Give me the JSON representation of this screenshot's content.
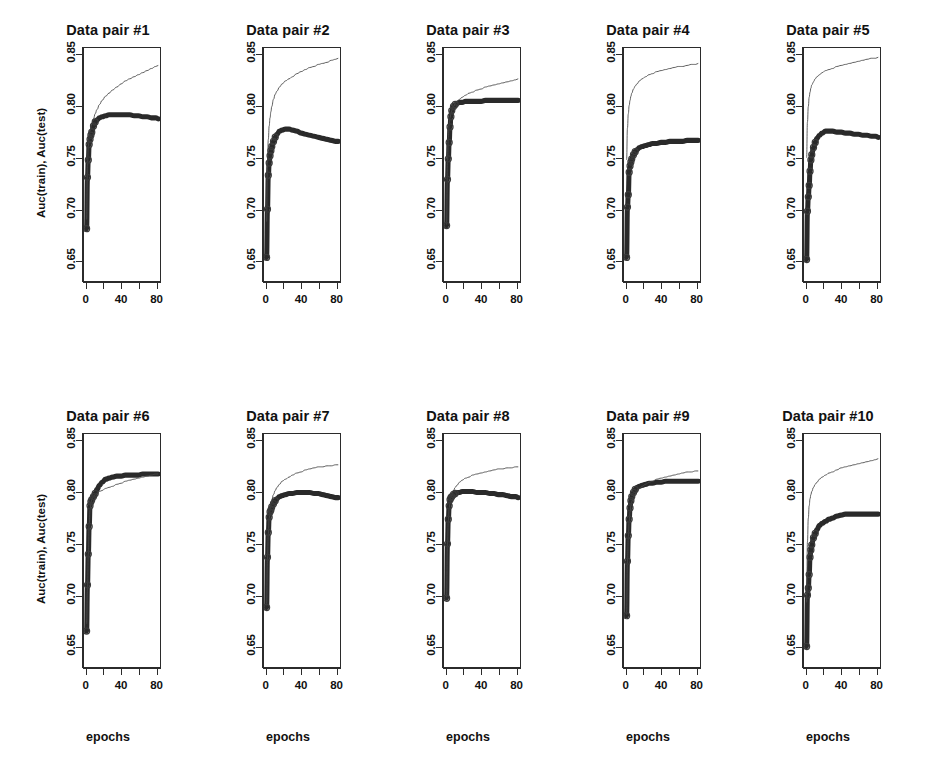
{
  "figure": {
    "axis_labels": {
      "y": "Auc(train), Auc(test)",
      "x": "epochs"
    },
    "panel_cols": 5,
    "panel_rows": 2
  },
  "axes": {
    "ylim": [
      0.63,
      0.857
    ],
    "xlim": [
      -3,
      85
    ],
    "y_ticks": [
      0.65,
      0.7,
      0.75,
      0.8,
      0.85
    ],
    "y_tick_labels": [
      "0.65",
      "0.70",
      "0.75",
      "0.80",
      "0.85"
    ],
    "x_ticks": [
      0,
      20,
      40,
      60,
      80
    ],
    "x_tick_labels": [
      "0",
      "",
      "40",
      "",
      "80"
    ],
    "grid": false
  },
  "legend": {
    "present": false
  },
  "series_names": {
    "train": "Auc(train)",
    "test": "Auc(test)"
  },
  "chart_data": {
    "type": "line",
    "title": "",
    "xlabel": "epochs",
    "ylabel": "Auc(train), Auc(test)",
    "xlim": [
      -3,
      85
    ],
    "ylim": [
      0.63,
      0.857
    ],
    "grid": false,
    "legend_position": "none",
    "x": [
      0,
      1,
      2,
      3,
      4,
      5,
      6,
      8,
      10,
      12,
      15,
      18,
      22,
      26,
      30,
      35,
      40,
      45,
      50,
      55,
      60,
      65,
      70,
      75,
      80,
      83
    ],
    "panels": [
      {
        "title": "Data pair #1",
        "series": [
          {
            "name": "Auc(train)",
            "style": "thin-line",
            "values": [
              0.69,
              0.742,
              0.761,
              0.77,
              0.776,
              0.78,
              0.783,
              0.788,
              0.793,
              0.797,
              0.802,
              0.806,
              0.81,
              0.813,
              0.816,
              0.819,
              0.822,
              0.825,
              0.827,
              0.829,
              0.831,
              0.833,
              0.835,
              0.837,
              0.839,
              0.84
            ]
          },
          {
            "name": "Auc(test)",
            "style": "thick-line-with-open-circles",
            "values": [
              0.681,
              0.731,
              0.748,
              0.763,
              0.768,
              0.772,
              0.775,
              0.781,
              0.785,
              0.787,
              0.789,
              0.79,
              0.791,
              0.792,
              0.792,
              0.792,
              0.792,
              0.792,
              0.792,
              0.791,
              0.791,
              0.79,
              0.79,
              0.789,
              0.789,
              0.788
            ]
          }
        ]
      },
      {
        "title": "Data pair #2",
        "series": [
          {
            "name": "Auc(train)",
            "style": "thin-line",
            "values": [
              0.688,
              0.745,
              0.768,
              0.781,
              0.789,
              0.795,
              0.8,
              0.807,
              0.812,
              0.815,
              0.819,
              0.822,
              0.825,
              0.827,
              0.829,
              0.832,
              0.834,
              0.836,
              0.838,
              0.839,
              0.841,
              0.842,
              0.843,
              0.845,
              0.846,
              0.847
            ]
          },
          {
            "name": "Auc(test)",
            "style": "thick-line-with-open-circles",
            "values": [
              0.653,
              0.7,
              0.733,
              0.745,
              0.752,
              0.757,
              0.761,
              0.766,
              0.77,
              0.773,
              0.776,
              0.777,
              0.778,
              0.778,
              0.777,
              0.776,
              0.774,
              0.773,
              0.772,
              0.771,
              0.77,
              0.769,
              0.768,
              0.767,
              0.766,
              0.766
            ]
          }
        ]
      },
      {
        "title": "Data pair #3",
        "series": [
          {
            "name": "Auc(train)",
            "style": "thin-line",
            "values": [
              0.685,
              0.745,
              0.77,
              0.782,
              0.789,
              0.793,
              0.796,
              0.8,
              0.803,
              0.805,
              0.807,
              0.809,
              0.811,
              0.813,
              0.814,
              0.816,
              0.817,
              0.819,
              0.82,
              0.821,
              0.822,
              0.823,
              0.824,
              0.825,
              0.826,
              0.827
            ]
          },
          {
            "name": "Auc(test)",
            "style": "thick-line-with-open-circles",
            "values": [
              0.684,
              0.729,
              0.749,
              0.765,
              0.78,
              0.79,
              0.796,
              0.8,
              0.802,
              0.803,
              0.804,
              0.804,
              0.805,
              0.805,
              0.805,
              0.805,
              0.805,
              0.806,
              0.806,
              0.806,
              0.806,
              0.806,
              0.806,
              0.806,
              0.806,
              0.806
            ]
          }
        ]
      },
      {
        "title": "Data pair #4",
        "series": [
          {
            "name": "Auc(train)",
            "style": "thin-line",
            "values": [
              0.748,
              0.779,
              0.793,
              0.801,
              0.806,
              0.81,
              0.813,
              0.817,
              0.82,
              0.822,
              0.825,
              0.827,
              0.829,
              0.831,
              0.832,
              0.834,
              0.835,
              0.836,
              0.837,
              0.838,
              0.839,
              0.839,
              0.84,
              0.841,
              0.841,
              0.842
            ]
          },
          {
            "name": "Auc(test)",
            "style": "thick-line-with-open-circles",
            "values": [
              0.653,
              0.702,
              0.714,
              0.736,
              0.742,
              0.746,
              0.749,
              0.753,
              0.756,
              0.758,
              0.76,
              0.761,
              0.762,
              0.763,
              0.764,
              0.764,
              0.765,
              0.765,
              0.766,
              0.766,
              0.766,
              0.766,
              0.767,
              0.767,
              0.767,
              0.767
            ]
          }
        ]
      },
      {
        "title": "Data pair #5",
        "series": [
          {
            "name": "Auc(train)",
            "style": "thin-line",
            "values": [
              0.75,
              0.785,
              0.8,
              0.809,
              0.814,
              0.818,
              0.821,
              0.824,
              0.827,
              0.829,
              0.831,
              0.833,
              0.835,
              0.836,
              0.837,
              0.839,
              0.84,
              0.841,
              0.842,
              0.843,
              0.844,
              0.845,
              0.846,
              0.847,
              0.847,
              0.848
            ]
          },
          {
            "name": "Auc(test)",
            "style": "thick-line-with-open-circles",
            "values": [
              0.651,
              0.698,
              0.712,
              0.723,
              0.737,
              0.748,
              0.753,
              0.76,
              0.765,
              0.769,
              0.772,
              0.774,
              0.776,
              0.776,
              0.776,
              0.775,
              0.775,
              0.774,
              0.774,
              0.773,
              0.773,
              0.772,
              0.772,
              0.771,
              0.771,
              0.77
            ]
          }
        ]
      },
      {
        "title": "Data pair #6",
        "series": [
          {
            "name": "Auc(train)",
            "style": "thin-line",
            "values": [
              0.672,
              0.705,
              0.74,
              0.769,
              0.783,
              0.79,
              0.793,
              0.796,
              0.798,
              0.799,
              0.801,
              0.802,
              0.804,
              0.805,
              0.806,
              0.808,
              0.809,
              0.811,
              0.812,
              0.813,
              0.814,
              0.815,
              0.816,
              0.817,
              0.818,
              0.818
            ]
          },
          {
            "name": "Auc(test)",
            "style": "thick-line-with-open-circles",
            "values": [
              0.665,
              0.71,
              0.74,
              0.767,
              0.787,
              0.791,
              0.793,
              0.796,
              0.799,
              0.803,
              0.807,
              0.81,
              0.813,
              0.814,
              0.815,
              0.816,
              0.816,
              0.817,
              0.817,
              0.817,
              0.817,
              0.818,
              0.818,
              0.818,
              0.818,
              0.818
            ]
          }
        ]
      },
      {
        "title": "Data pair #7",
        "series": [
          {
            "name": "Auc(train)",
            "style": "thin-line",
            "values": [
              0.69,
              0.735,
              0.76,
              0.775,
              0.783,
              0.789,
              0.793,
              0.798,
              0.802,
              0.805,
              0.808,
              0.811,
              0.813,
              0.815,
              0.817,
              0.819,
              0.82,
              0.822,
              0.823,
              0.824,
              0.825,
              0.825,
              0.826,
              0.826,
              0.827,
              0.827
            ]
          },
          {
            "name": "Auc(test)",
            "style": "thick-line-with-open-circles",
            "values": [
              0.688,
              0.737,
              0.761,
              0.776,
              0.781,
              0.783,
              0.786,
              0.789,
              0.792,
              0.794,
              0.796,
              0.797,
              0.798,
              0.799,
              0.799,
              0.8,
              0.8,
              0.8,
              0.8,
              0.799,
              0.799,
              0.798,
              0.797,
              0.796,
              0.795,
              0.795
            ]
          }
        ]
      },
      {
        "title": "Data pair #8",
        "series": [
          {
            "name": "Auc(train)",
            "style": "thin-line",
            "values": [
              0.698,
              0.75,
              0.773,
              0.785,
              0.791,
              0.795,
              0.798,
              0.802,
              0.805,
              0.807,
              0.81,
              0.812,
              0.814,
              0.815,
              0.817,
              0.818,
              0.819,
              0.82,
              0.821,
              0.822,
              0.823,
              0.823,
              0.824,
              0.824,
              0.825,
              0.825
            ]
          },
          {
            "name": "Auc(test)",
            "style": "thick-line-with-open-circles",
            "values": [
              0.697,
              0.75,
              0.774,
              0.787,
              0.793,
              0.795,
              0.796,
              0.798,
              0.799,
              0.8,
              0.8,
              0.801,
              0.801,
              0.801,
              0.801,
              0.8,
              0.8,
              0.8,
              0.799,
              0.799,
              0.798,
              0.798,
              0.797,
              0.796,
              0.796,
              0.795
            ]
          }
        ]
      },
      {
        "title": "Data pair #9",
        "series": [
          {
            "name": "Auc(train)",
            "style": "thin-line",
            "values": [
              0.681,
              0.733,
              0.757,
              0.772,
              0.781,
              0.787,
              0.791,
              0.796,
              0.799,
              0.801,
              0.804,
              0.806,
              0.808,
              0.81,
              0.811,
              0.813,
              0.814,
              0.815,
              0.816,
              0.817,
              0.818,
              0.819,
              0.82,
              0.82,
              0.821,
              0.821
            ]
          },
          {
            "name": "Auc(test)",
            "style": "thick-line-with-open-circles",
            "values": [
              0.68,
              0.733,
              0.758,
              0.774,
              0.785,
              0.792,
              0.796,
              0.8,
              0.803,
              0.805,
              0.806,
              0.807,
              0.808,
              0.809,
              0.809,
              0.81,
              0.81,
              0.811,
              0.811,
              0.811,
              0.811,
              0.811,
              0.811,
              0.811,
              0.811,
              0.811
            ]
          }
        ]
      },
      {
        "title": "Data pair #10",
        "series": [
          {
            "name": "Auc(train)",
            "style": "thin-line",
            "values": [
              0.693,
              0.752,
              0.775,
              0.787,
              0.794,
              0.798,
              0.801,
              0.805,
              0.808,
              0.81,
              0.813,
              0.815,
              0.817,
              0.819,
              0.82,
              0.822,
              0.824,
              0.825,
              0.826,
              0.827,
              0.828,
              0.829,
              0.83,
              0.831,
              0.832,
              0.833
            ]
          },
          {
            "name": "Auc(test)",
            "style": "thick-line-with-open-circles",
            "values": [
              0.65,
              0.7,
              0.707,
              0.72,
              0.737,
              0.744,
              0.749,
              0.756,
              0.76,
              0.764,
              0.768,
              0.77,
              0.772,
              0.774,
              0.775,
              0.777,
              0.778,
              0.779,
              0.779,
              0.779,
              0.779,
              0.779,
              0.779,
              0.779,
              0.779,
              0.779
            ]
          }
        ]
      }
    ],
    "marker_epochs": [
      0,
      1,
      2,
      3,
      4,
      5,
      6,
      8,
      10
    ]
  }
}
